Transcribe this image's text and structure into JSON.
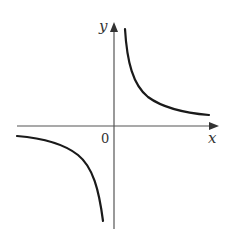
{
  "diagram": {
    "type": "function-graph",
    "labels": {
      "x_axis": "x",
      "y_axis": "y",
      "origin": "0"
    },
    "colors": {
      "axis": "#555555",
      "curve": "#1a1a1a",
      "background": "#ffffff"
    },
    "branches": [
      {
        "name": "upper-right",
        "quadrant": "I"
      },
      {
        "name": "lower-left",
        "quadrant": "III"
      }
    ]
  }
}
